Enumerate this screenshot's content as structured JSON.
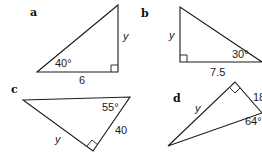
{
  "diagrams": [
    {
      "id": "a",
      "letter": "a",
      "angle": "40°",
      "side": "6",
      "unknown": "y",
      "vertices": [
        [
          37,
          72
        ],
        [
          118,
          5
        ],
        [
          118,
          72
        ]
      ],
      "right_angle_at": [
        118,
        72
      ]
    },
    {
      "id": "b",
      "letter": "b",
      "angle": "30°",
      "side": "7.5",
      "unknown": "y",
      "vertices": [
        [
          180,
          7
        ],
        [
          180,
          62
        ],
        [
          262,
          62
        ]
      ],
      "right_angle_at": [
        180,
        62
      ]
    },
    {
      "id": "c",
      "letter": "c",
      "angle": "55°",
      "side": "40",
      "unknown": "y",
      "vertices": [
        [
          23,
          100
        ],
        [
          130,
          97
        ],
        [
          93,
          151
        ]
      ],
      "right_angle_at": [
        93,
        151
      ]
    },
    {
      "id": "d",
      "letter": "d",
      "angle": "64°",
      "side": "18",
      "unknown": "y",
      "vertices": [
        [
          168,
          146
        ],
        [
          235,
          82
        ],
        [
          262,
          113
        ]
      ],
      "right_angle_at": [
        235,
        82
      ]
    }
  ]
}
